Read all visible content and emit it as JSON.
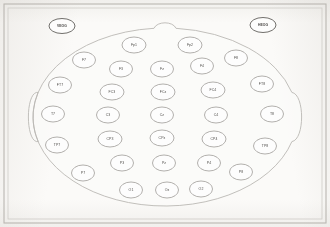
{
  "diagram": {
    "type": "eeg-montage",
    "system": "10-20",
    "orientation": "top-down, nose at top",
    "colors": {
      "background": "#fbfaf8",
      "frame": "#b8b5b0",
      "head_outline": "#b9b7b2",
      "electrode_stroke": "#8e8b86",
      "label_text": "#4a4845"
    },
    "frame": {
      "outer": {
        "x": 4,
        "y": 4,
        "width": 322,
        "height": 219
      },
      "inner": {
        "x": 8,
        "y": 8,
        "width": 314,
        "height": 211
      }
    },
    "head": {
      "center_x": 165,
      "center_y": 117,
      "radius_x": 132,
      "radius_y": 89,
      "nose": {
        "x": 165,
        "y": 22,
        "width": 22,
        "height": 10
      },
      "ears": [
        {
          "name": "left-ear",
          "x": 30,
          "y": 117
        },
        {
          "name": "right-ear",
          "x": 300,
          "y": 117
        }
      ]
    },
    "eog_electrodes": [
      {
        "label": "VEOG",
        "x": 62,
        "y": 26,
        "rx": 13,
        "ry": 7.5,
        "name": "electrode-veog"
      },
      {
        "label": "HEOG",
        "x": 263,
        "y": 25,
        "rx": 13,
        "ry": 7.5,
        "name": "electrode-heog"
      }
    ],
    "electrode_rows": [
      {
        "row": "frontopolar",
        "electrodes": [
          {
            "label": "Fp1",
            "x": 134,
            "y": 45,
            "rx": 12,
            "ry": 8
          },
          {
            "label": "Fp2",
            "x": 190,
            "y": 45,
            "rx": 12,
            "ry": 8
          }
        ]
      },
      {
        "row": "frontal",
        "electrodes": [
          {
            "label": "F7",
            "x": 84,
            "y": 60,
            "rx": 11.5,
            "ry": 8
          },
          {
            "label": "F3",
            "x": 121,
            "y": 69,
            "rx": 11.5,
            "ry": 8
          },
          {
            "label": "Fz",
            "x": 162,
            "y": 69,
            "rx": 11.5,
            "ry": 8
          },
          {
            "label": "F4",
            "x": 202,
            "y": 66,
            "rx": 11.5,
            "ry": 8
          },
          {
            "label": "F8",
            "x": 236,
            "y": 58,
            "rx": 11.5,
            "ry": 8
          }
        ]
      },
      {
        "row": "frontocentral",
        "electrodes": [
          {
            "label": "FT7",
            "x": 60,
            "y": 85,
            "rx": 11.5,
            "ry": 8
          },
          {
            "label": "FC3",
            "x": 112,
            "y": 92,
            "rx": 12,
            "ry": 8
          },
          {
            "label": "FCz",
            "x": 163,
            "y": 92,
            "rx": 12,
            "ry": 8
          },
          {
            "label": "FC4",
            "x": 213,
            "y": 90,
            "rx": 12,
            "ry": 8
          },
          {
            "label": "FT8",
            "x": 262,
            "y": 84,
            "rx": 11.5,
            "ry": 8
          }
        ]
      },
      {
        "row": "central",
        "electrodes": [
          {
            "label": "T7",
            "x": 53,
            "y": 114,
            "rx": 11.5,
            "ry": 8
          },
          {
            "label": "C3",
            "x": 108,
            "y": 115,
            "rx": 11.5,
            "ry": 8
          },
          {
            "label": "Cz",
            "x": 162,
            "y": 115,
            "rx": 11.5,
            "ry": 8
          },
          {
            "label": "C4",
            "x": 216,
            "y": 115,
            "rx": 11.5,
            "ry": 8
          },
          {
            "label": "T8",
            "x": 272,
            "y": 114,
            "rx": 11.5,
            "ry": 8
          }
        ]
      },
      {
        "row": "centroparietal",
        "electrodes": [
          {
            "label": "TP7",
            "x": 57,
            "y": 145,
            "rx": 11.5,
            "ry": 8
          },
          {
            "label": "CP3",
            "x": 110,
            "y": 139,
            "rx": 12,
            "ry": 8
          },
          {
            "label": "CPz",
            "x": 162,
            "y": 138,
            "rx": 12,
            "ry": 8
          },
          {
            "label": "CP4",
            "x": 214,
            "y": 139,
            "rx": 12,
            "ry": 8
          },
          {
            "label": "TP8",
            "x": 265,
            "y": 146,
            "rx": 11.5,
            "ry": 8
          }
        ]
      },
      {
        "row": "parietal",
        "electrodes": [
          {
            "label": "P7",
            "x": 83,
            "y": 173,
            "rx": 11.5,
            "ry": 8
          },
          {
            "label": "P3",
            "x": 122,
            "y": 163,
            "rx": 11.5,
            "ry": 8
          },
          {
            "label": "Pz",
            "x": 164,
            "y": 163,
            "rx": 11.5,
            "ry": 8
          },
          {
            "label": "P4",
            "x": 209,
            "y": 163,
            "rx": 11.5,
            "ry": 8
          },
          {
            "label": "P8",
            "x": 241,
            "y": 172,
            "rx": 11.5,
            "ry": 8
          }
        ]
      },
      {
        "row": "occipital",
        "electrodes": [
          {
            "label": "O1",
            "x": 131,
            "y": 190,
            "rx": 11.5,
            "ry": 8
          },
          {
            "label": "Oz",
            "x": 167,
            "y": 190,
            "rx": 11.5,
            "ry": 8
          },
          {
            "label": "O2",
            "x": 201,
            "y": 189,
            "rx": 11.5,
            "ry": 8
          }
        ]
      }
    ]
  }
}
